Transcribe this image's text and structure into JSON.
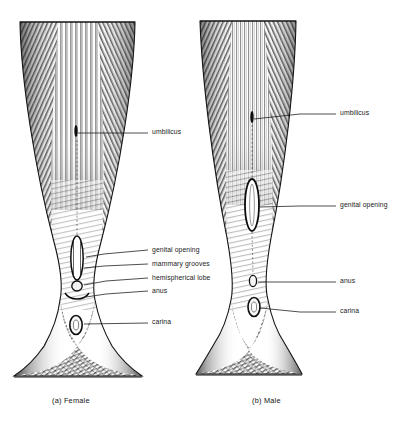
{
  "plate": {
    "title": "Ventral view of cetacean body showing sexual dimorphism",
    "background_color": "#ffffff",
    "ink_color": "#151515",
    "label_font_size_px": 6.8,
    "caption_font_size_px": 7.4
  },
  "figures": [
    {
      "id": "female",
      "caption": "(a)  Female",
      "caption_x": 52,
      "caption_y": 400,
      "outline": {
        "top_y": 22,
        "bottom_y": 379,
        "top_left_x": 20,
        "top_right_x": 135,
        "waist_x_left": 57,
        "waist_x_right": 96,
        "waist_y": 300,
        "fluke_left_x": 14,
        "fluke_right_x": 142,
        "fluke_y": 377
      },
      "features": [
        {
          "name": "umbilicus",
          "shape": "slit",
          "cx": 76,
          "cy": 131,
          "rx": 1.6,
          "ry": 6
        },
        {
          "name": "genital opening",
          "shape": "long-oval",
          "cx": 77,
          "cy": 258,
          "rx": 6,
          "ry": 22
        },
        {
          "name": "mammary grooves",
          "shape": "paired-lines",
          "cx": 77,
          "cy": 268,
          "rx": 7,
          "ry": 16
        },
        {
          "name": "hemispherical lobe",
          "shape": "round-lobe",
          "cx": 77,
          "cy": 286,
          "rx": 5,
          "ry": 5
        },
        {
          "name": "anus",
          "shape": "arc",
          "cx": 77,
          "cy": 296,
          "rx": 10,
          "ry": 5
        },
        {
          "name": "carina",
          "shape": "oval",
          "cx": 76,
          "cy": 325,
          "rx": 6,
          "ry": 9
        }
      ],
      "labels": [
        {
          "text": "umbilicus",
          "text_x": 152,
          "text_y": 132,
          "leader_from_x": 78,
          "leader_from_y": 133,
          "leader_to_x": 148,
          "leader_to_y": 133
        },
        {
          "text": "genital opening",
          "text_x": 152,
          "text_y": 251,
          "leader_from_x": 86,
          "leader_from_y": 257,
          "leader_to_x": 148,
          "leader_to_y": 250
        },
        {
          "text": "mammary grooves",
          "text_x": 152,
          "text_y": 265,
          "leader_from_x": 84,
          "leader_from_y": 268,
          "leader_to_x": 148,
          "leader_to_y": 264
        },
        {
          "text": "hemispherical lobe",
          "text_x": 152,
          "text_y": 279,
          "leader_from_x": 84,
          "leader_from_y": 285,
          "leader_to_x": 148,
          "leader_to_y": 278
        },
        {
          "text": "anus",
          "text_x": 152,
          "text_y": 292,
          "leader_from_x": 86,
          "leader_from_y": 297,
          "leader_to_x": 148,
          "leader_to_y": 291
        },
        {
          "text": "carina",
          "text_x": 152,
          "text_y": 322,
          "leader_from_x": 84,
          "leader_from_y": 324,
          "leader_to_x": 148,
          "leader_to_y": 323
        }
      ]
    },
    {
      "id": "male",
      "caption": "(b)  Male",
      "caption_x": 252,
      "caption_y": 400,
      "outline": {
        "top_y": 21,
        "bottom_y": 376,
        "top_left_x": 200,
        "top_right_x": 296,
        "waist_x_left": 233,
        "waist_x_right": 272,
        "waist_y": 300,
        "fluke_left_x": 196,
        "fluke_right_x": 302,
        "fluke_y": 374
      },
      "features": [
        {
          "name": "umbilicus",
          "shape": "slit",
          "cx": 252,
          "cy": 117,
          "rx": 1.6,
          "ry": 6
        },
        {
          "name": "genital opening",
          "shape": "long-oval",
          "cx": 252,
          "cy": 205,
          "rx": 7,
          "ry": 26
        },
        {
          "name": "anus",
          "shape": "small-oval",
          "cx": 253,
          "cy": 281,
          "rx": 3.5,
          "ry": 5.5
        },
        {
          "name": "carina",
          "shape": "oval",
          "cx": 254,
          "cy": 307,
          "rx": 6,
          "ry": 9
        }
      ],
      "labels": [
        {
          "text": "umbilicus",
          "text_x": 340,
          "text_y": 113,
          "leader_from_x": 254,
          "leader_from_y": 119,
          "leader_to_x": 336,
          "leader_to_y": 114
        },
        {
          "text": "genital opening",
          "text_x": 340,
          "text_y": 205,
          "leader_from_x": 260,
          "leader_from_y": 207,
          "leader_to_x": 336,
          "leader_to_y": 206
        },
        {
          "text": "anus",
          "text_x": 340,
          "text_y": 281,
          "leader_from_x": 258,
          "leader_from_y": 282,
          "leader_to_x": 336,
          "leader_to_y": 282
        },
        {
          "text": "carina",
          "text_x": 340,
          "text_y": 311,
          "leader_from_x": 260,
          "leader_from_y": 308,
          "leader_to_x": 336,
          "leader_to_y": 312
        }
      ]
    }
  ]
}
